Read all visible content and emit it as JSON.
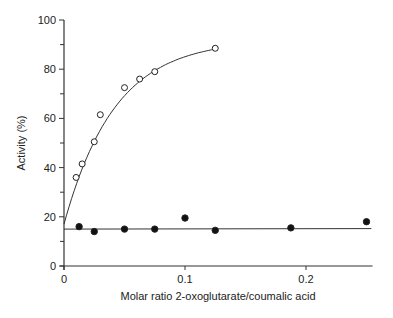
{
  "chart_data": {
    "type": "scatter",
    "title": "",
    "xlabel": "Molar ratio 2-oxoglutarate/coumalic acid",
    "ylabel": "Activity (%)",
    "xlim": [
      0,
      0.255
    ],
    "ylim": [
      0,
      100
    ],
    "x_ticks": [
      0,
      0.1,
      0.2
    ],
    "x_tick_labels": [
      "0",
      "0.1",
      "0.2"
    ],
    "y_ticks": [
      0,
      20,
      40,
      60,
      80,
      100
    ],
    "y_tick_labels": [
      "0",
      "20",
      "40",
      "60",
      "80",
      "100"
    ],
    "y_minor_ticks": [
      10,
      30,
      50,
      70,
      90
    ],
    "grid": false,
    "legend": null,
    "series": [
      {
        "name": "open circles",
        "marker": "open-circle",
        "fit": "saturation curve",
        "x": [
          0.01,
          0.015,
          0.025,
          0.03,
          0.05,
          0.0625,
          0.075,
          0.125
        ],
        "y": [
          36,
          41.5,
          50.5,
          61.5,
          72.5,
          76,
          79,
          88.5
        ]
      },
      {
        "name": "filled circles",
        "marker": "filled-circle",
        "fit": "horizontal line at 15",
        "x": [
          0.0125,
          0.025,
          0.05,
          0.075,
          0.1,
          0.125,
          0.1875,
          0.25
        ],
        "y": [
          16,
          14,
          15,
          15,
          19.5,
          14.5,
          15.5,
          18
        ]
      }
    ]
  }
}
